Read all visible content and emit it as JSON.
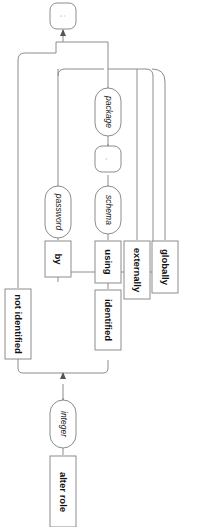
{
  "diagram": {
    "title": "alter role",
    "orientation": "rotated-90-clockwise",
    "kind": "railroad-syntax-diagram",
    "colors": {
      "line": "#8c8c8c",
      "arrow": "#555555",
      "box_fill": "#ffffff",
      "text": "#111111",
      "background": "#ffffff"
    },
    "nodes": {
      "start_keyword": {
        "label": "alter role",
        "shape": "rect"
      },
      "integer": {
        "label": "integer",
        "shape": "oval"
      },
      "not_identified": {
        "label": "not identified",
        "shape": "rect"
      },
      "identified": {
        "label": "identified",
        "shape": "rect"
      },
      "by": {
        "label": "by",
        "shape": "rect"
      },
      "using": {
        "label": "using",
        "shape": "rect"
      },
      "externally": {
        "label": "externally",
        "shape": "rect"
      },
      "globally": {
        "label": "globally",
        "shape": "rect"
      },
      "password": {
        "label": "password",
        "shape": "oval"
      },
      "schema": {
        "label": "schema",
        "shape": "oval"
      },
      "dot_separator": {
        "label": ".",
        "shape": "oval-small"
      },
      "package": {
        "label": "package",
        "shape": "oval"
      },
      "semicolon": {
        "label": ";",
        "shape": "oval-small"
      }
    }
  }
}
